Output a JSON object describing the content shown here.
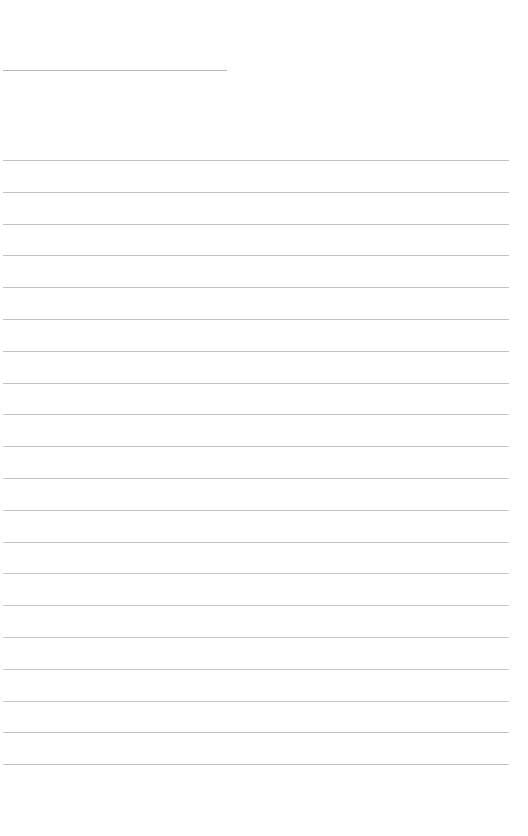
{
  "page": {
    "type": "blank lined writing sheet",
    "background_color": "#ffffff",
    "line_color": "#c4c4c4",
    "title_line": {
      "left": 3,
      "top": 70,
      "width": 224
    },
    "rules": {
      "count": 20,
      "first_top": 160,
      "spacing": 31.8,
      "left": 3,
      "width": 506
    }
  }
}
